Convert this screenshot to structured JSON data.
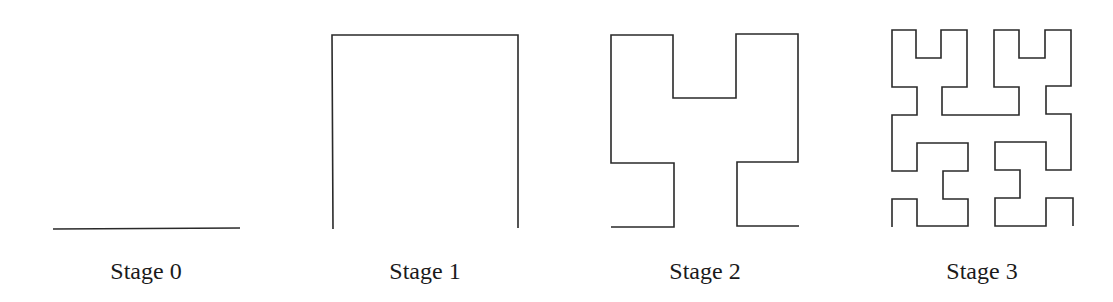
{
  "figure": {
    "stroke_color": "#2a2a2a",
    "stages": [
      {
        "label": "Stage 0",
        "order": 0,
        "label_x": 146
      },
      {
        "label": "Stage 1",
        "order": 1,
        "label_x": 425
      },
      {
        "label": "Stage 2",
        "order": 2,
        "label_x": 705
      },
      {
        "label": "Stage 3",
        "order": 3,
        "label_x": 982
      }
    ]
  }
}
